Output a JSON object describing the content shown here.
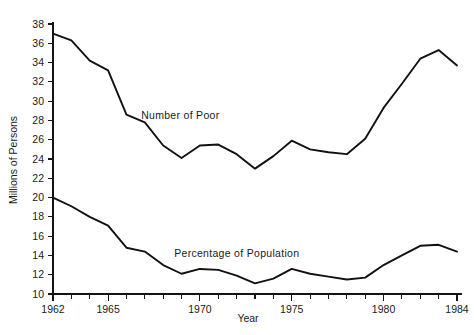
{
  "chart_data": {
    "type": "line",
    "title": "",
    "subtitle": "",
    "xlabel": "Year",
    "ylabel": "Millions of Persons",
    "xlim": [
      1962,
      1984
    ],
    "ylim": [
      10,
      38
    ],
    "grid": false,
    "legend_position": "inline-annotation",
    "x_ticks_labeled": [
      "1962",
      "1965",
      "1970",
      "1975",
      "1980",
      "1984"
    ],
    "x_ticks_labeled_values": [
      1962,
      1965,
      1970,
      1975,
      1980,
      1984
    ],
    "x_ticks_all": [
      1962,
      1963,
      1964,
      1965,
      1966,
      1967,
      1968,
      1969,
      1970,
      1971,
      1972,
      1973,
      1974,
      1975,
      1976,
      1977,
      1978,
      1979,
      1980,
      1981,
      1982,
      1983,
      1984
    ],
    "y_ticks": [
      10,
      12,
      14,
      16,
      18,
      20,
      22,
      24,
      26,
      28,
      30,
      32,
      34,
      36,
      38
    ],
    "y_tick_labels": [
      "10",
      "12",
      "14",
      "16",
      "18",
      "20",
      "22",
      "24",
      "26",
      "28",
      "30",
      "32",
      "34",
      "36",
      "38"
    ],
    "x": [
      1962,
      1963,
      1964,
      1965,
      1966,
      1967,
      1968,
      1969,
      1970,
      1971,
      1972,
      1973,
      1974,
      1975,
      1976,
      1977,
      1978,
      1979,
      1980,
      1981,
      1982,
      1983,
      1984
    ],
    "series": [
      {
        "name": "Number of Poor",
        "label_x": 1966.8,
        "label_y": 28.1,
        "color": "#111111",
        "values": [
          37.0,
          36.3,
          34.2,
          33.2,
          28.6,
          27.8,
          25.4,
          24.1,
          25.4,
          25.5,
          24.5,
          23.0,
          24.3,
          25.9,
          25.0,
          24.7,
          24.5,
          26.1,
          29.3,
          31.8,
          34.4,
          35.3,
          33.7
        ]
      },
      {
        "name": "Percentage of Population",
        "label_x": 1968.6,
        "label_y": 13.8,
        "color": "#111111",
        "values": [
          20.0,
          19.1,
          18.0,
          17.1,
          14.8,
          14.4,
          13.0,
          12.1,
          12.6,
          12.5,
          11.9,
          11.1,
          11.6,
          12.6,
          12.1,
          11.8,
          11.5,
          11.7,
          13.0,
          14.0,
          15.0,
          15.1,
          14.4
        ]
      }
    ],
    "annotations": [
      {
        "text": "Number of Poor",
        "x": 1966.8,
        "y": 28.1
      },
      {
        "text": "Percentage of Population",
        "x": 1968.6,
        "y": 13.8
      }
    ]
  }
}
